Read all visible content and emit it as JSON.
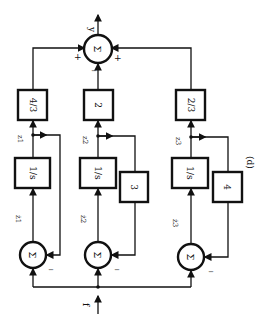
{
  "figure_label": "(d)",
  "output_sum": {
    "symbol": "Σ",
    "output_label": "y",
    "signs": {
      "left": "+",
      "bottom": "−",
      "right": "+"
    }
  },
  "input_label": "f",
  "branches": [
    {
      "integrator": "1/s",
      "integrator_num": "1",
      "integrator_den": "s",
      "state_label": "z1",
      "state_in_label": "ż1",
      "output_gain": "4/3",
      "feedback_gain": "",
      "sum_symbol": "Σ",
      "feedback_sign": "−"
    },
    {
      "integrator": "1/s",
      "integrator_num": "1",
      "integrator_den": "s",
      "state_label": "z2",
      "state_in_label": "ż2",
      "output_gain": "2",
      "feedback_gain": "3",
      "sum_symbol": "Σ",
      "feedback_sign": "−"
    },
    {
      "integrator": "1/s",
      "integrator_num": "1",
      "integrator_den": "s",
      "state_label": "z3",
      "state_in_label": "ż3",
      "output_gain": "2/3",
      "feedback_gain": "4",
      "sum_symbol": "Σ",
      "feedback_sign": "−"
    }
  ]
}
